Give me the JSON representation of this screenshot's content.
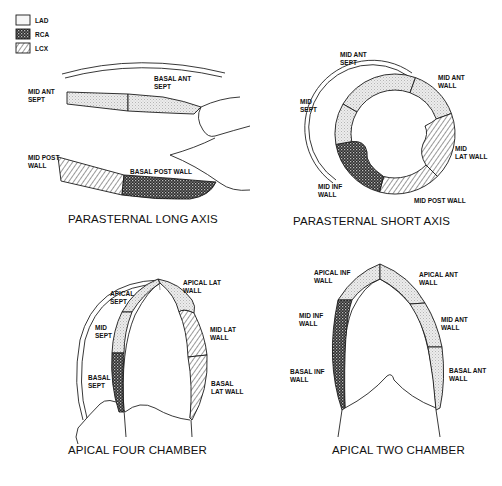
{
  "legend": {
    "items": [
      {
        "key": "LAD",
        "label": "LAD",
        "pattern": "dotted-light"
      },
      {
        "key": "RCA",
        "label": "RCA",
        "pattern": "crosshatch-dark"
      },
      {
        "key": "LCX",
        "label": "LCX",
        "pattern": "diagonal-hatch"
      }
    ]
  },
  "colors": {
    "lad_fill": "#e4e4e4",
    "rca_fill": "#3a3a3a",
    "lcx_stroke": "#333333",
    "outline": "#1a1a1a",
    "background": "#ffffff"
  },
  "panels": {
    "plax": {
      "title": "PARASTERNAL LONG AXIS",
      "segments": [
        {
          "label_lines": [
            "MID ANT",
            "SEPT"
          ],
          "territory": "LAD"
        },
        {
          "label_lines": [
            "BASAL ANT",
            "SEPT"
          ],
          "territory": "LAD"
        },
        {
          "label_lines": [
            "MID POST",
            "WALL"
          ],
          "territory": "LCX"
        },
        {
          "label_lines": [
            "BASAL POST WALL"
          ],
          "territory": "RCA"
        }
      ]
    },
    "psax": {
      "title": "PARASTERNAL SHORT AXIS",
      "segments": [
        {
          "label_lines": [
            "MID ANT",
            "SEPT"
          ],
          "territory": "LAD"
        },
        {
          "label_lines": [
            "MID ANT",
            "WALL"
          ],
          "territory": "LAD"
        },
        {
          "label_lines": [
            "MID",
            "SEPT"
          ],
          "territory": "LAD"
        },
        {
          "label_lines": [
            "MID",
            "LAT WALL"
          ],
          "territory": "LCX"
        },
        {
          "label_lines": [
            "MID INF",
            "WALL"
          ],
          "territory": "RCA"
        },
        {
          "label_lines": [
            "MID POST WALL"
          ],
          "territory": "LCX"
        }
      ]
    },
    "a4c": {
      "title": "APICAL FOUR CHAMBER",
      "segments": [
        {
          "label_lines": [
            "APICAL",
            "SEPT"
          ],
          "territory": "LAD"
        },
        {
          "label_lines": [
            "APICAL LAT",
            "WALL"
          ],
          "territory": "LAD"
        },
        {
          "label_lines": [
            "MID",
            "SEPT"
          ],
          "territory": "LAD"
        },
        {
          "label_lines": [
            "MID LAT",
            "WALL"
          ],
          "territory": "LCX"
        },
        {
          "label_lines": [
            "BASAL",
            "SEPT"
          ],
          "territory": "RCA"
        },
        {
          "label_lines": [
            "BASAL",
            "LAT WALL"
          ],
          "territory": "LCX"
        }
      ]
    },
    "a2c": {
      "title": "APICAL TWO CHAMBER",
      "segments": [
        {
          "label_lines": [
            "APICAL INF",
            "WALL"
          ],
          "territory": "LAD"
        },
        {
          "label_lines": [
            "APICAL ANT",
            "WALL"
          ],
          "territory": "LAD"
        },
        {
          "label_lines": [
            "MID INF",
            "WALL"
          ],
          "territory": "RCA"
        },
        {
          "label_lines": [
            "MID ANT",
            "WALL"
          ],
          "territory": "LAD"
        },
        {
          "label_lines": [
            "BASAL INF",
            "WALL"
          ],
          "territory": "RCA"
        },
        {
          "label_lines": [
            "BASAL ANT",
            "WALL"
          ],
          "territory": "LAD"
        }
      ]
    }
  }
}
